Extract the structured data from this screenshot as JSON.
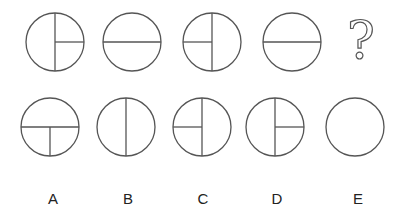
{
  "puzzle": {
    "question_row": [
      {
        "id": "q1",
        "lines": [
          "vertical-full",
          "right-half-horizontal"
        ]
      },
      {
        "id": "q2",
        "lines": [
          "horizontal-full"
        ]
      },
      {
        "id": "q3",
        "lines": [
          "vertical-full",
          "left-half-horizontal"
        ]
      },
      {
        "id": "q4",
        "lines": [
          "horizontal-full"
        ]
      },
      {
        "id": "q5",
        "symbol": "?"
      }
    ],
    "options": [
      {
        "label": "A",
        "lines": [
          "horizontal-full",
          "bottom-half-vertical"
        ]
      },
      {
        "label": "B",
        "lines": [
          "vertical-full"
        ]
      },
      {
        "label": "C",
        "lines": [
          "vertical-full",
          "left-half-horizontal"
        ]
      },
      {
        "label": "D",
        "lines": [
          "vertical-full",
          "right-half-horizontal"
        ]
      },
      {
        "label": "E",
        "lines": []
      }
    ],
    "colors": {
      "stroke": "#555555",
      "background": "#ffffff",
      "label": "#222222"
    }
  }
}
